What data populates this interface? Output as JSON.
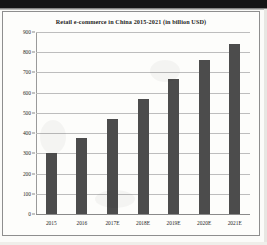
{
  "figure": {
    "title": "Retail e-commerce in China 2015-2021 (in billion USD)"
  },
  "chart_data": {
    "type": "bar",
    "title": "Retail e-commerce in China 2015-2021 (in billion USD)",
    "xlabel": "",
    "ylabel": "",
    "ylim": [
      0,
      900
    ],
    "ytick_step": 100,
    "grid": true,
    "legend": "none",
    "bar_color": "#4c4c4c",
    "units": "billion USD",
    "categories": [
      "2015",
      "2016",
      "2017E",
      "2018E",
      "2019E",
      "2020E",
      "2021E"
    ],
    "values": [
      300,
      375,
      470,
      570,
      670,
      760,
      840
    ],
    "ticks": [
      "0",
      "100",
      "200",
      "300",
      "400",
      "500",
      "600",
      "700",
      "800",
      "900"
    ]
  }
}
